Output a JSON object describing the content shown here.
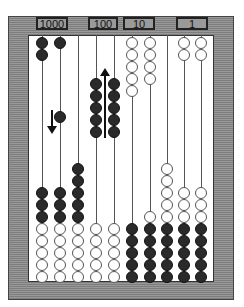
{
  "labels": [
    {
      "text": "1000",
      "x": 36,
      "w": 32
    },
    {
      "text": "100",
      "x": 88,
      "w": 30
    },
    {
      "text": "10",
      "x": 123,
      "w": 32
    },
    {
      "text": "1",
      "x": 176,
      "w": 32
    }
  ],
  "colors": {
    "frame": "#8a8a8a",
    "bead_dark": "#2a2a2a",
    "bead_light": "#ffffff",
    "rod": "#555555"
  },
  "rods": [
    {
      "x": 42,
      "beads": [
        {
          "c": "black",
          "y": [
            37,
            49
          ]
        },
        {
          "c": "black",
          "y": [
            187,
            199,
            211
          ]
        },
        {
          "c": "white",
          "y": [
            223,
            235,
            247,
            259,
            271
          ]
        }
      ]
    },
    {
      "x": 60,
      "beads": [
        {
          "c": "black",
          "y": [
            37,
            111
          ]
        },
        {
          "c": "black",
          "y": [
            187,
            199,
            211
          ]
        },
        {
          "c": "white",
          "y": [
            223,
            235,
            247,
            259,
            271
          ]
        }
      ]
    },
    {
      "x": 78,
      "beads": [
        {
          "c": "black",
          "y": [
            163,
            175,
            187,
            199,
            211
          ]
        },
        {
          "c": "white",
          "y": [
            223,
            235,
            247,
            259,
            271
          ]
        }
      ]
    },
    {
      "x": 96,
      "beads": [
        {
          "c": "black",
          "y": [
            78,
            90,
            102,
            114,
            126
          ]
        },
        {
          "c": "white",
          "y": [
            223,
            235,
            247,
            259,
            271
          ]
        }
      ]
    },
    {
      "x": 114,
      "beads": [
        {
          "c": "black",
          "y": [
            78,
            90,
            102,
            114,
            126
          ]
        },
        {
          "c": "white",
          "y": [
            223,
            235,
            247,
            259,
            271
          ]
        }
      ]
    },
    {
      "x": 132,
      "beads": [
        {
          "c": "white",
          "y": [
            37,
            49,
            61,
            73,
            85
          ]
        },
        {
          "c": "black",
          "y": [
            223,
            235,
            247,
            259,
            271
          ]
        }
      ]
    },
    {
      "x": 150,
      "beads": [
        {
          "c": "white",
          "y": [
            37,
            49,
            61,
            73
          ]
        },
        {
          "c": "white",
          "y": [
            211
          ]
        },
        {
          "c": "black",
          "y": [
            223,
            235,
            247,
            259,
            271
          ]
        }
      ]
    },
    {
      "x": 167,
      "beads": [
        {
          "c": "white",
          "y": [
            163,
            175,
            187,
            199,
            211
          ]
        },
        {
          "c": "black",
          "y": [
            223,
            235,
            247,
            259,
            271
          ]
        }
      ]
    },
    {
      "x": 184,
      "beads": [
        {
          "c": "white",
          "y": [
            37,
            49
          ]
        },
        {
          "c": "white",
          "y": [
            187,
            199,
            211
          ]
        },
        {
          "c": "black",
          "y": [
            223,
            235,
            247,
            259,
            271
          ]
        }
      ]
    },
    {
      "x": 201,
      "beads": [
        {
          "c": "white",
          "y": [
            37,
            49
          ]
        },
        {
          "c": "white",
          "y": [
            187,
            199,
            211
          ]
        },
        {
          "c": "black",
          "y": [
            223,
            235,
            247,
            259,
            271
          ]
        }
      ]
    }
  ],
  "arrows": [
    {
      "name": "down-arrow-icon",
      "dir": "down",
      "x": 52,
      "y1": 110,
      "y2": 134
    },
    {
      "name": "up-arrow-icon",
      "dir": "up",
      "x": 105,
      "y1": 68,
      "y2": 138
    }
  ]
}
